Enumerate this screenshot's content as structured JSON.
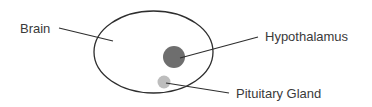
{
  "diagram": {
    "labels": {
      "brain": "Brain",
      "hypothalamus": "Hypothalamus",
      "pituitary": "Pituitary Gland"
    },
    "colors": {
      "outline": "#2e2e2e",
      "hypothalamus_fill": "#6e6e6e",
      "pituitary_fill": "#bdbdbd",
      "text": "#3a3a3a"
    }
  }
}
